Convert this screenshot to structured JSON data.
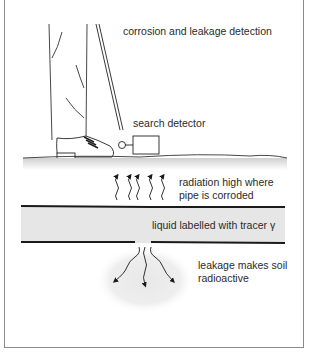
{
  "diagram": {
    "title": "corrosion and leakage detection",
    "labels": {
      "detector": "search detector",
      "radiation_line1": "radiation high where",
      "radiation_line2": "pipe is corroded",
      "liquid": "liquid labelled with tracer γ",
      "leakage_line1": "leakage makes soil",
      "leakage_line2": "radioactive"
    },
    "colors": {
      "line": "#1a1a1a",
      "pipe_fill": "#e6e6e6",
      "leak_cloud": "#eeeeee",
      "frame": "#8a8a8a"
    }
  }
}
